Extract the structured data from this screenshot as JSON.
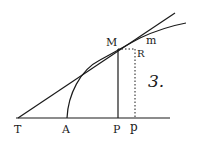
{
  "figure": {
    "number_label": "3.",
    "points": {
      "T": "T",
      "A": "A",
      "P": "P",
      "p": "p",
      "M": "M",
      "m": "m",
      "R": "R"
    },
    "ink_color": "#1a1a1a",
    "background": "#ffffff"
  }
}
